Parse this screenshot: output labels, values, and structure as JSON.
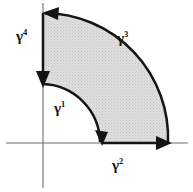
{
  "figure": {
    "background_color": "#ffffff",
    "width": 193,
    "height": 192,
    "fill_color": "#d8d8d8",
    "contour_color": "#141414",
    "axis_color": "#6f6f6f",
    "origin": {
      "x": 43,
      "y": 143
    },
    "inner_radius": 59,
    "outer_radius": 125
  },
  "axes": {
    "x_axis_name": "horizontal-axis",
    "y_axis_name": "vertical-axis",
    "x_axis_label": "",
    "y_axis_label": ""
  },
  "labels": {
    "gamma1": {
      "base": "γ",
      "exponent": "1"
    },
    "gamma2": {
      "base": "γ",
      "exponent": "2"
    },
    "gamma3": {
      "base": "γ",
      "exponent": "3"
    },
    "gamma4": {
      "base": "γ",
      "exponent": "4"
    }
  },
  "segments": [
    {
      "id": "gamma1",
      "label": "γ1",
      "kind": "inner-arc",
      "radius": 59,
      "direction": "clockwise",
      "arrow": "down",
      "start": {
        "x": 43,
        "y": 84
      },
      "end": {
        "x": 102,
        "y": 143
      }
    },
    {
      "id": "gamma2",
      "label": "γ2",
      "kind": "radial-segment",
      "direction": "outward-right",
      "arrow": "right",
      "start": {
        "x": 102,
        "y": 143
      },
      "end": {
        "x": 168,
        "y": 143
      }
    },
    {
      "id": "gamma3",
      "label": "γ3",
      "kind": "outer-arc",
      "radius": 125,
      "direction": "counterclockwise",
      "arrow": "left",
      "start": {
        "x": 168,
        "y": 143
      },
      "end": {
        "x": 43,
        "y": 13
      }
    },
    {
      "id": "gamma4",
      "label": "γ4",
      "kind": "radial-segment",
      "direction": "inward-down",
      "arrow": "down",
      "start": {
        "x": 43,
        "y": 13
      },
      "end": {
        "x": 43,
        "y": 84
      }
    }
  ]
}
